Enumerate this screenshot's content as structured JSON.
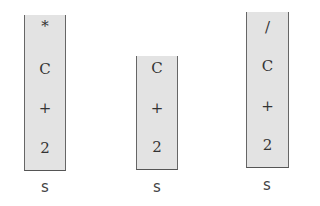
{
  "stacks": [
    {
      "label": "s",
      "items": [
        "*",
        "C",
        "+",
        "2"
      ]
    },
    {
      "label": "s",
      "items": [
        "C",
        "+",
        "2"
      ]
    },
    {
      "label": "s",
      "items": [
        "/",
        "C",
        "+",
        "2"
      ]
    }
  ]
}
